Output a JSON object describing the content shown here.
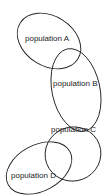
{
  "diagram": {
    "type": "overlapping-ellipses",
    "stroke_color": "#222222",
    "background": "#ffffff",
    "populations": [
      {
        "label": "population A"
      },
      {
        "label": "population B"
      },
      {
        "label": "population C"
      },
      {
        "label": "population D"
      }
    ]
  }
}
